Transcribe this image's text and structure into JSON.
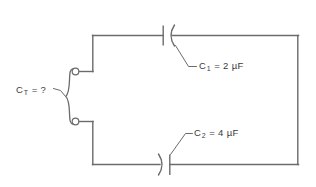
{
  "diagram": {
    "type": "series-capacitor-circuit",
    "width": 316,
    "height": 187,
    "background_color": "#ffffff",
    "line_color": "#6b6b6b",
    "text_color": "#3a3a3a"
  },
  "labels": {
    "total_capacitance": {
      "symbol": "C",
      "subscript": "T",
      "equals": " = ",
      "value": "?",
      "full_text": "C T = ?"
    },
    "capacitor_1": {
      "symbol": "C",
      "subscript": "1",
      "equals": " = ",
      "value": "2 µF",
      "full_text": "C 1 = 2 µF"
    },
    "capacitor_2": {
      "symbol": "C",
      "subscript": "2",
      "equals": " = ",
      "value": "4 µF",
      "full_text": "C 2 = 4 µF"
    }
  },
  "components": {
    "capacitor_1": {
      "name": "C1",
      "capacitance": "2 µF",
      "orientation": "straight-plate-left-curved-plate-right",
      "position": "top-branch"
    },
    "capacitor_2": {
      "name": "C2",
      "capacitance": "4 µF",
      "orientation": "curved-plate-left-straight-plate-right",
      "position": "bottom-branch"
    },
    "terminal_top": {
      "name": "top-terminal",
      "shape": "open-circle"
    },
    "terminal_bottom": {
      "name": "bottom-terminal",
      "shape": "open-circle"
    },
    "terminal_brace": {
      "name": "terminal-brace",
      "shape": "curly-brace"
    }
  }
}
